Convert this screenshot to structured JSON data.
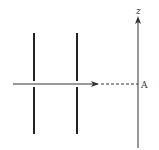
{
  "diagram": {
    "type": "double-slit setup",
    "axis": {
      "label": "z",
      "color": "#333333"
    },
    "point": {
      "label": "A"
    },
    "barriers": [
      {
        "name": "first barrier with slit"
      },
      {
        "name": "second barrier with slit"
      }
    ],
    "beam": {
      "style": "solid arrow then dashed line to screen"
    },
    "colors": {
      "ink": "#222222",
      "background": "#ffffff"
    }
  }
}
